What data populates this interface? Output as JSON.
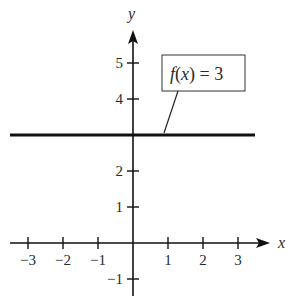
{
  "chart_data": {
    "type": "line",
    "title": "",
    "xlabel": "x",
    "ylabel": "y",
    "xlim": [
      -3.3,
      3.9
    ],
    "ylim": [
      -1.5,
      5.9
    ],
    "grid": false,
    "x_ticks": [
      -3,
      -2,
      -1,
      1,
      2,
      3
    ],
    "x_tick_labels": [
      "−3",
      "−2",
      "−1",
      "1",
      "2",
      "3"
    ],
    "y_ticks": [
      -1,
      1,
      2,
      4,
      5
    ],
    "y_tick_labels": [
      "−1",
      "1",
      "2",
      "4",
      "5"
    ],
    "series": [
      {
        "name": "f(x) = 3",
        "x": [
          -3.5,
          3.5
        ],
        "y": [
          3,
          3
        ]
      }
    ],
    "annotations": [
      {
        "text": "f(x) = 3",
        "type": "callout-box",
        "points_to": [
          0.9,
          3
        ]
      }
    ],
    "colors": {
      "line": "#111111",
      "axis": "#111111",
      "text": "#2a2a2a"
    }
  },
  "labels": {
    "x_axis": "x",
    "y_axis": "y",
    "function": "f(x) = 3",
    "fn_name": "f",
    "fn_open": "(",
    "fn_var": "x",
    "fn_rest": ") = 3"
  }
}
